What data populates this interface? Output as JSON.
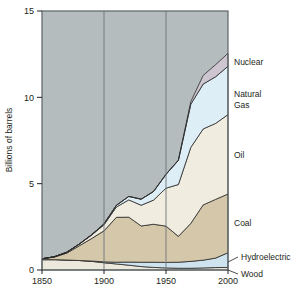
{
  "chart_data": {
    "type": "area",
    "title": "",
    "xlabel": "",
    "ylabel": "Billions of barrels",
    "xlim": [
      1850,
      2000
    ],
    "ylim": [
      0,
      15
    ],
    "xticks": [
      "1850",
      "1900",
      "1950",
      "2000"
    ],
    "xtick_values": [
      1850,
      1900,
      1950,
      2000
    ],
    "yticks": [
      "0",
      "5",
      "10",
      "15"
    ],
    "ytick_values": [
      0,
      5,
      10,
      15
    ],
    "grid": "vertical gridlines at 1900 and 1950",
    "legend_position": "right, inline labels with leader lines",
    "stacked": true,
    "x": [
      1850,
      1860,
      1870,
      1880,
      1890,
      1900,
      1910,
      1920,
      1930,
      1940,
      1950,
      1960,
      1970,
      1980,
      1990,
      2000
    ],
    "series": [
      {
        "name": "Wood",
        "color": "#ede8dc",
        "values": [
          0.6,
          0.6,
          0.58,
          0.55,
          0.5,
          0.42,
          0.35,
          0.28,
          0.2,
          0.15,
          0.12,
          0.1,
          0.1,
          0.12,
          0.14,
          0.15
        ]
      },
      {
        "name": "Hydroelectric",
        "color": "#cfe3ee",
        "values": [
          0.0,
          0.0,
          0.0,
          0.0,
          0.02,
          0.05,
          0.1,
          0.18,
          0.25,
          0.3,
          0.32,
          0.35,
          0.4,
          0.45,
          0.55,
          0.85
        ]
      },
      {
        "name": "Coal",
        "color": "#d5c8aa",
        "values": [
          0.05,
          0.15,
          0.4,
          0.85,
          1.3,
          1.8,
          2.6,
          2.6,
          2.1,
          2.2,
          2.1,
          1.5,
          2.2,
          3.2,
          3.4,
          3.4
        ]
      },
      {
        "name": "Oil",
        "color": "#f0ece0",
        "values": [
          0.0,
          0.02,
          0.05,
          0.1,
          0.2,
          0.35,
          0.6,
          1.0,
          1.2,
          1.4,
          2.2,
          3.0,
          4.4,
          4.4,
          4.4,
          4.6
        ]
      },
      {
        "name": "Natural Gas",
        "color": "#ddeef6",
        "values": [
          0.0,
          0.0,
          0.0,
          0.0,
          0.02,
          0.05,
          0.1,
          0.2,
          0.35,
          0.5,
          0.8,
          1.4,
          2.5,
          2.6,
          2.7,
          2.8
        ]
      },
      {
        "name": "Nuclear",
        "color": "#cdc6d0",
        "values": [
          0.0,
          0.0,
          0.0,
          0.0,
          0.0,
          0.0,
          0.0,
          0.0,
          0.0,
          0.0,
          0.0,
          0.02,
          0.15,
          0.5,
          0.7,
          0.75
        ]
      }
    ],
    "background_color": "#b5bcbd",
    "plot_border_color": "#5a6467"
  },
  "labels": {
    "nuclear": "Nuclear",
    "natural_gas_line1": "Natural",
    "natural_gas_line2": "Gas",
    "oil": "Oil",
    "coal": "Coal",
    "hydroelectric": "Hydroelectric",
    "wood": "Wood",
    "y_axis": "Billions of barrels"
  },
  "ticks": {
    "y": [
      "15",
      "10",
      "5",
      "0"
    ],
    "x": [
      "1850",
      "1900",
      "1950",
      "2000"
    ]
  },
  "caption": ""
}
